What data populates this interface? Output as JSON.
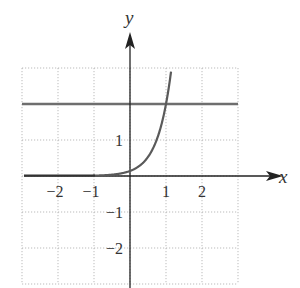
{
  "chart_data": {
    "type": "line",
    "title": "",
    "xlabel": "x",
    "ylabel": "y",
    "xlim": [
      -3,
      3
    ],
    "ylim": [
      -3,
      3
    ],
    "grid": true,
    "grid_style": "dotted",
    "x_ticks": [
      {
        "value": -2,
        "label": "−2"
      },
      {
        "value": -1,
        "label": "−1"
      },
      {
        "value": 1,
        "label": "1"
      },
      {
        "value": 2,
        "label": "2"
      }
    ],
    "y_ticks": [
      {
        "value": 1,
        "label": "1"
      },
      {
        "value": -1,
        "label": "−1"
      },
      {
        "value": -2,
        "label": "−2"
      }
    ],
    "series": [
      {
        "name": "exponential curve",
        "kind": "function",
        "description": "Exponential growth curve approaching y=0 as x→−∞, passing near (0, 0.14) and (1, 2)",
        "x": [
          -3,
          -2,
          -1,
          -0.5,
          0,
          0.25,
          0.5,
          0.75,
          1,
          1.14
        ],
        "values": [
          0.0,
          0.001,
          0.01,
          0.04,
          0.14,
          0.27,
          0.53,
          1.03,
          2.0,
          2.95
        ],
        "color": "#5a5a5a"
      },
      {
        "name": "horizontal line y = 2",
        "kind": "horizontal_line",
        "y": 2,
        "x_range": [
          -3,
          3
        ],
        "color": "#6a6a6a"
      }
    ],
    "legend": null
  },
  "labels": {
    "x_axis": "x",
    "y_axis": "y"
  }
}
